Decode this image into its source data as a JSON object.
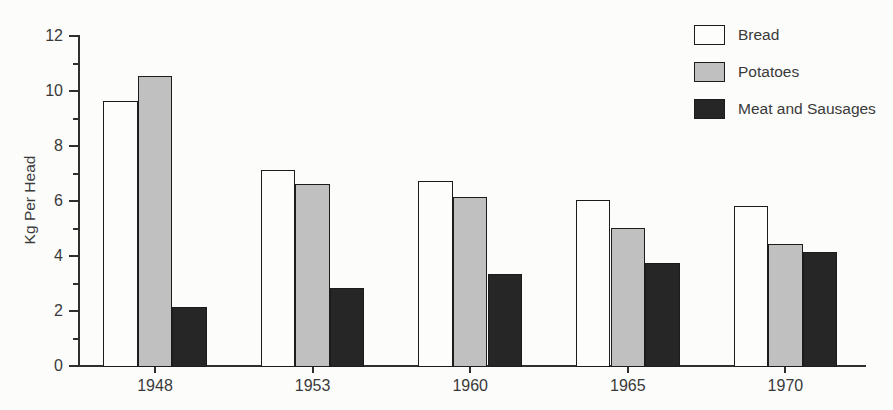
{
  "chart_data": {
    "type": "bar",
    "title": "",
    "categories": [
      "1948",
      "1953",
      "1960",
      "1965",
      "1970"
    ],
    "series": [
      {
        "name": "Bread",
        "color": "#fdfdfc",
        "values": [
          9.6,
          7.1,
          6.7,
          6.0,
          5.8
        ]
      },
      {
        "name": "Potatoes",
        "color": "#c0c0c0",
        "values": [
          10.5,
          6.6,
          6.1,
          5.0,
          4.4
        ]
      },
      {
        "name": "Meat and Sausages",
        "color": "#262626",
        "values": [
          2.1,
          2.8,
          3.3,
          3.7,
          4.1
        ]
      }
    ],
    "xlabel": "",
    "ylabel": "Kg Per Head",
    "ylim": [
      0,
      12
    ],
    "ytick_step": 2,
    "yminor_step": 1,
    "grid": false,
    "legend_position": "top-right"
  },
  "colors": {
    "axis": "#2f2f2f",
    "text": "#3a3a3a",
    "background": "#fcfcfa",
    "bar_border": "#1c1c1c"
  }
}
